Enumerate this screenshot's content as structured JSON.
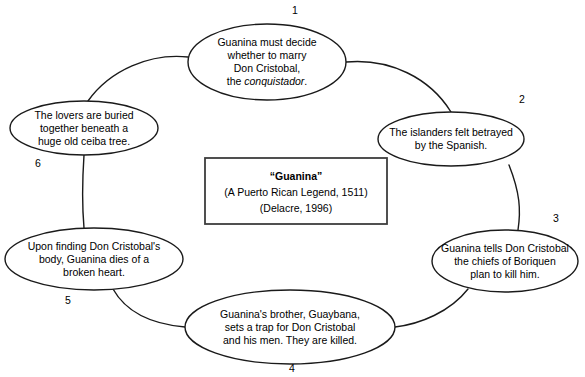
{
  "center_box": {
    "title": "“Guanina”",
    "subtitle": "(A Puerto Rican Legend, 1511)",
    "citation": "(Delacre, 1996)"
  },
  "nodes": [
    {
      "number": "1",
      "lines": [
        "Guanina must decide",
        "whether to marry",
        "Don Cristobal,",
        "the conquistador."
      ],
      "italic_last_word": "conquistador",
      "label_x": 295,
      "label_y": 14,
      "cx": 267,
      "cy": 62,
      "rx": 79,
      "ry": 38
    },
    {
      "number": "2",
      "lines": [
        "The islanders felt betrayed",
        "by the Spanish."
      ],
      "label_x": 522,
      "label_y": 103,
      "cx": 451,
      "cy": 139,
      "rx": 73,
      "ry": 27
    },
    {
      "number": "3",
      "lines": [
        "Guanina tells Don Cristobal",
        "the chiefs of Boriquen",
        "plan to kill him."
      ],
      "label_x": 556,
      "label_y": 222,
      "cx": 505,
      "cy": 261,
      "rx": 73,
      "ry": 31
    },
    {
      "number": "4",
      "lines": [
        "Guanina's brother, Guaybana,",
        "sets a trap for Don Cristobal",
        "and his men. They are killed."
      ],
      "label_x": 292,
      "label_y": 372,
      "cx": 290,
      "cy": 327,
      "rx": 105,
      "ry": 37
    },
    {
      "number": "5",
      "lines": [
        "Upon finding Don Cristobal's",
        "body, Guanina dies of a",
        "broken heart."
      ],
      "label_x": 68,
      "label_y": 304,
      "cx": 94,
      "cy": 259,
      "rx": 89,
      "ry": 31
    },
    {
      "number": "6",
      "lines": [
        "The lovers are buried",
        "together beneath a",
        "huge old ceiba tree."
      ],
      "label_x": 38,
      "label_y": 167,
      "cx": 84,
      "cy": 128,
      "rx": 74,
      "ry": 27
    }
  ],
  "connectors": [
    {
      "name": "connector-6-to-1",
      "path": "M 188 57 C 150 53 110 70 88 101"
    },
    {
      "name": "connector-1-to-2",
      "path": "M 346 62 C 390 58 430 78 451 112"
    },
    {
      "name": "connector-2-to-3",
      "path": "M 509 165 C 520 193 521 210 518 230"
    },
    {
      "name": "connector-3-to-4",
      "path": "M 468 289 C 450 312 420 324 395 327"
    },
    {
      "name": "connector-4-to-5",
      "path": "M 185 327 C 150 324 126 312 113 289"
    },
    {
      "name": "connector-5-to-6",
      "path": "M 84 228 C 82 205 82 185 84 155"
    }
  ],
  "center_box_geometry": {
    "x": 205,
    "y": 158,
    "width": 182,
    "height": 66
  }
}
